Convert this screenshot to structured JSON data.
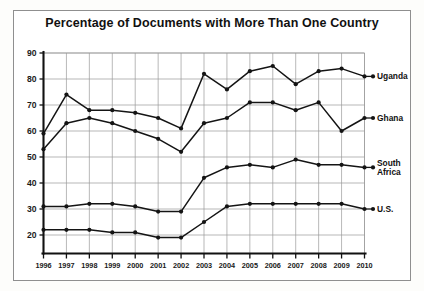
{
  "figure": {
    "title": "Percentage of Documents with More Than One Country"
  },
  "chart_data": {
    "type": "line",
    "title": "Percentage of Documents with More Than One Country",
    "xlabel": "",
    "ylabel": "",
    "xlim": [
      1996,
      2010
    ],
    "ylim": [
      15,
      90
    ],
    "yticks": [
      20,
      30,
      40,
      50,
      60,
      70,
      80,
      90
    ],
    "grid": true,
    "legend_position": "right-inline",
    "categories": [
      1996,
      1997,
      1998,
      1999,
      2000,
      2001,
      2002,
      2003,
      2004,
      2005,
      2006,
      2007,
      2008,
      2009,
      2010
    ],
    "series": [
      {
        "name": "Uganda",
        "values": [
          59,
          74,
          68,
          68,
          67,
          65,
          61,
          82,
          76,
          83,
          85,
          78,
          83,
          84,
          81
        ]
      },
      {
        "name": "Ghana",
        "values": [
          53,
          63,
          65,
          63,
          60,
          57,
          52,
          63,
          65,
          71,
          71,
          68,
          71,
          60,
          65
        ]
      },
      {
        "name": "South Africa",
        "values": [
          31,
          31,
          32,
          32,
          31,
          29,
          29,
          42,
          46,
          47,
          46,
          49,
          47,
          47,
          46
        ]
      },
      {
        "name": "U.S.",
        "values": [
          22,
          22,
          22,
          21,
          21,
          19,
          19,
          25,
          31,
          32,
          32,
          32,
          32,
          32,
          30
        ]
      }
    ]
  },
  "axis": {
    "ytick_labels": [
      "90",
      "80",
      "70",
      "60",
      "50",
      "40",
      "30",
      "20"
    ],
    "xtick_labels": [
      "1996",
      "1997",
      "1998",
      "1999",
      "2000",
      "2001",
      "2002",
      "2003",
      "2004",
      "2005",
      "2006",
      "2007",
      "2008",
      "2009",
      "2010"
    ]
  },
  "legend": {
    "items": [
      {
        "label": "Uganda",
        "label_lines": [
          "Uganda"
        ]
      },
      {
        "label": "Ghana",
        "label_lines": [
          "Ghana"
        ]
      },
      {
        "label": "South Africa",
        "label_lines": [
          "South",
          "Africa"
        ]
      },
      {
        "label": "U.S.",
        "label_lines": [
          "U.S."
        ]
      }
    ]
  },
  "colors": {
    "ink": "#141414",
    "grid": "#9a9a9a",
    "frame": "#8f8f8f",
    "background": "#ffffff"
  }
}
